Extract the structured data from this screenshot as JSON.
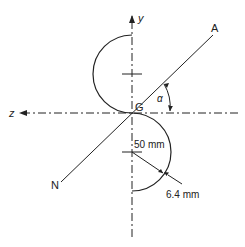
{
  "diagram": {
    "type": "cross-section of Z-shaped semicircular thin-walled section",
    "labels": {
      "y_axis": "y",
      "z_axis": "z",
      "centroid": "G",
      "angle": "α",
      "line_end_a": "A",
      "line_end_n": "N",
      "radius_dim": "50 mm",
      "thickness_dim": "6.4 mm"
    },
    "colors": {
      "stroke": "#222222",
      "background": "#ffffff"
    }
  }
}
